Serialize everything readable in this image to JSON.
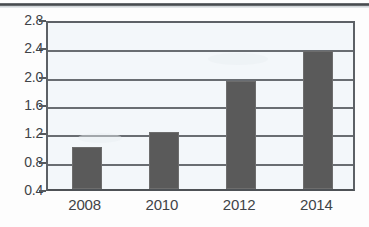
{
  "chart_data": {
    "type": "bar",
    "title": "",
    "subtitle": "",
    "xlabel": "",
    "ylabel": "",
    "categories": [
      "2008",
      "2010",
      "2012",
      "2014"
    ],
    "values": [
      1.0,
      1.2,
      1.92,
      2.35
    ],
    "series": [
      {
        "name": "",
        "values": [
          1.0,
          1.2,
          1.92,
          2.35
        ]
      }
    ],
    "ylim": [
      0.4,
      2.8
    ],
    "y_ticks": [
      "0.4",
      "0.8",
      "1.2",
      "1.6",
      "2.0",
      "2.4",
      "2.8"
    ],
    "y_tick_values": [
      0.4,
      0.8,
      1.2,
      1.6,
      2.0,
      2.4,
      2.8
    ],
    "x_ticks": [
      "2008",
      "2010",
      "2012",
      "2014"
    ],
    "grid": "horizontal",
    "legend": "none",
    "bar_color": "#5a5a5a",
    "axis_color": "#5d6166",
    "plot_background": "#f3f7fa",
    "page_background": "#fdfdfd"
  },
  "figure": {
    "scan_artifact_label": "scan-line"
  }
}
